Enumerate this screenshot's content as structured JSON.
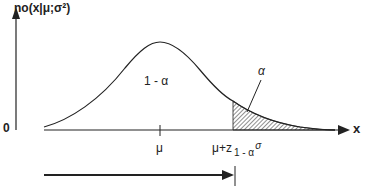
{
  "diagram": {
    "y_axis_label": "no(x|μ;σ²)",
    "origin_label": "0",
    "x_axis_label": "x",
    "mean_label": "μ",
    "quantile_label": {
      "base": "μ+z",
      "subscript": "1 - α",
      "suffix": "σ"
    },
    "body_area_label": "1 - α",
    "tail_area_label": "α",
    "colors": {
      "line": "#222222",
      "background": "#ffffff"
    }
  }
}
